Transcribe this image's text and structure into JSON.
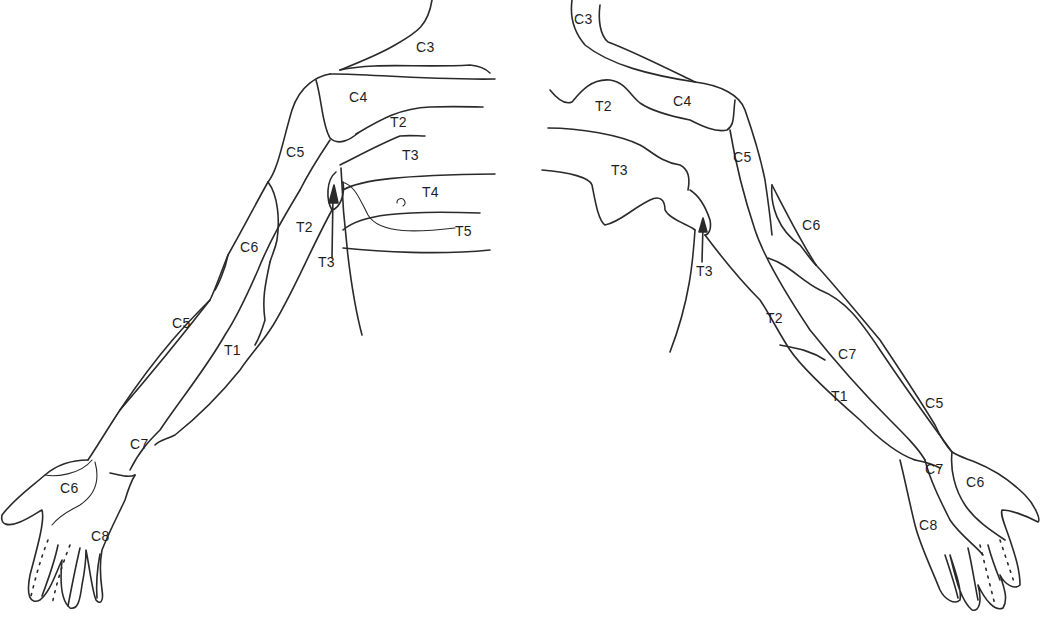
{
  "figure": {
    "line_color": "#2a2a2a",
    "background": "#ffffff"
  },
  "left_view": {
    "labels": [
      {
        "id": "c3",
        "text": "C3",
        "x": 416,
        "y": 40
      },
      {
        "id": "c4",
        "text": "C4",
        "x": 349,
        "y": 90
      },
      {
        "id": "t2-chest",
        "text": "T2",
        "x": 390,
        "y": 115
      },
      {
        "id": "c5-shoulder",
        "text": "C5",
        "x": 286,
        "y": 145
      },
      {
        "id": "t3-chest",
        "text": "T3",
        "x": 402,
        "y": 148
      },
      {
        "id": "t4",
        "text": "T4",
        "x": 422,
        "y": 185
      },
      {
        "id": "t2-arm",
        "text": "T2",
        "x": 296,
        "y": 220
      },
      {
        "id": "t5",
        "text": "T5",
        "x": 455,
        "y": 224
      },
      {
        "id": "c6-arm",
        "text": "C6",
        "x": 240,
        "y": 240
      },
      {
        "id": "t3-axilla",
        "text": "T3",
        "x": 318,
        "y": 255
      },
      {
        "id": "c5-forearm",
        "text": "C5",
        "x": 172,
        "y": 316
      },
      {
        "id": "t1",
        "text": "T1",
        "x": 224,
        "y": 343
      },
      {
        "id": "c7",
        "text": "C7",
        "x": 130,
        "y": 437
      },
      {
        "id": "c6-hand",
        "text": "C6",
        "x": 60,
        "y": 481
      },
      {
        "id": "c8",
        "text": "C8",
        "x": 91,
        "y": 529
      }
    ]
  },
  "right_view": {
    "labels": [
      {
        "id": "c3",
        "text": "C3",
        "x": 574,
        "y": 12
      },
      {
        "id": "t2-chest",
        "text": "T2",
        "x": 595,
        "y": 99
      },
      {
        "id": "c4",
        "text": "C4",
        "x": 673,
        "y": 94
      },
      {
        "id": "c5-shoulder",
        "text": "C5",
        "x": 733,
        "y": 150
      },
      {
        "id": "t3-chest",
        "text": "T3",
        "x": 611,
        "y": 163
      },
      {
        "id": "c6-arm",
        "text": "C6",
        "x": 802,
        "y": 218
      },
      {
        "id": "t3-axilla",
        "text": "T3",
        "x": 696,
        "y": 264
      },
      {
        "id": "t2-arm",
        "text": "T2",
        "x": 766,
        "y": 311
      },
      {
        "id": "c7-arm",
        "text": "C7",
        "x": 838,
        "y": 347
      },
      {
        "id": "t1",
        "text": "T1",
        "x": 831,
        "y": 389
      },
      {
        "id": "c5-forearm",
        "text": "C5",
        "x": 925,
        "y": 396
      },
      {
        "id": "c7-wrist",
        "text": "C7",
        "x": 925,
        "y": 462
      },
      {
        "id": "c6-hand",
        "text": "C6",
        "x": 966,
        "y": 475
      },
      {
        "id": "c8",
        "text": "C8",
        "x": 919,
        "y": 518
      }
    ]
  }
}
